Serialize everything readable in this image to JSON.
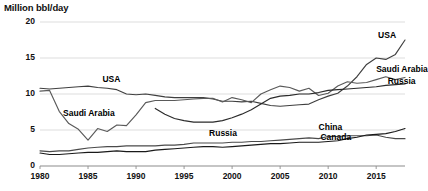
{
  "chart_data": {
    "type": "line",
    "title": "Million bbl/day",
    "xlabel": "",
    "ylabel": "Million bbl/day",
    "xlim": [
      1980,
      2018
    ],
    "ylim": [
      0,
      20
    ],
    "grid": true,
    "legend_position": "inline-annotations",
    "yticks": [
      "0",
      "5",
      "10",
      "15",
      "20"
    ],
    "ytick_values": [
      0,
      5,
      10,
      15,
      20
    ],
    "xticks": [
      "1980",
      "1985",
      "1990",
      "1995",
      "2000",
      "2005",
      "2010",
      "2015"
    ],
    "xtick_values": [
      1980,
      1985,
      1990,
      1995,
      2000,
      2005,
      2010,
      2015
    ],
    "x": [
      1980,
      1981,
      1982,
      1983,
      1984,
      1985,
      1986,
      1987,
      1988,
      1989,
      1990,
      1991,
      1992,
      1993,
      1994,
      1995,
      1996,
      1997,
      1998,
      1999,
      2000,
      2001,
      2002,
      2003,
      2004,
      2005,
      2006,
      2007,
      2008,
      2009,
      2010,
      2011,
      2012,
      2013,
      2014,
      2015,
      2016,
      2017,
      2018
    ],
    "series": [
      {
        "name": "USA",
        "color": "#3f3f3f",
        "values": [
          10.8,
          10.7,
          10.8,
          10.9,
          11.0,
          11.1,
          10.9,
          10.8,
          10.6,
          10.0,
          9.9,
          10.0,
          9.8,
          9.6,
          9.5,
          9.5,
          9.5,
          9.5,
          9.3,
          9.0,
          9.0,
          8.9,
          9.0,
          8.7,
          8.4,
          8.3,
          8.4,
          8.5,
          8.6,
          9.2,
          9.7,
          10.1,
          11.1,
          12.4,
          14.1,
          15.0,
          14.8,
          15.5,
          17.5
        ]
      },
      {
        "name": "Saudi Arabia",
        "color": "#5a5a5a",
        "values": [
          10.4,
          10.5,
          7.6,
          5.9,
          5.1,
          3.6,
          5.2,
          4.8,
          5.7,
          5.6,
          7.1,
          8.8,
          9.1,
          9.1,
          9.1,
          9.2,
          9.3,
          9.4,
          9.4,
          8.9,
          9.5,
          9.2,
          8.8,
          10.0,
          10.6,
          11.1,
          10.9,
          10.4,
          10.8,
          9.8,
          10.1,
          11.1,
          11.7,
          11.5,
          11.6,
          12.0,
          12.4,
          12.0,
          12.3
        ]
      },
      {
        "name": "Russia",
        "color": "#2b2b2b",
        "values": [
          null,
          null,
          null,
          null,
          null,
          null,
          null,
          null,
          null,
          null,
          null,
          null,
          8.0,
          7.2,
          6.6,
          6.3,
          6.1,
          6.1,
          6.1,
          6.3,
          6.7,
          7.2,
          7.8,
          8.6,
          9.4,
          9.7,
          9.8,
          10.0,
          10.0,
          10.2,
          10.5,
          10.6,
          10.7,
          10.8,
          10.9,
          11.0,
          11.2,
          11.3,
          11.4
        ]
      },
      {
        "name": "China",
        "color": "#4a4a4a",
        "values": [
          2.1,
          2.0,
          2.1,
          2.1,
          2.3,
          2.5,
          2.6,
          2.7,
          2.7,
          2.8,
          2.8,
          2.8,
          2.8,
          2.9,
          2.9,
          3.0,
          3.2,
          3.2,
          3.2,
          3.2,
          3.3,
          3.3,
          3.4,
          3.4,
          3.5,
          3.6,
          3.7,
          3.8,
          3.9,
          3.8,
          4.1,
          4.1,
          4.2,
          4.2,
          4.2,
          4.3,
          4.0,
          3.8,
          3.8
        ]
      },
      {
        "name": "Canada",
        "color": "#1a1a1a",
        "values": [
          1.8,
          1.6,
          1.6,
          1.7,
          1.8,
          1.9,
          1.9,
          2.0,
          2.1,
          2.0,
          2.0,
          2.0,
          2.2,
          2.3,
          2.4,
          2.5,
          2.6,
          2.7,
          2.7,
          2.6,
          2.7,
          2.8,
          2.9,
          3.0,
          3.1,
          3.1,
          3.2,
          3.3,
          3.3,
          3.3,
          3.4,
          3.5,
          3.8,
          4.0,
          4.3,
          4.4,
          4.5,
          4.8,
          5.2
        ]
      }
    ],
    "annotations": [
      {
        "text": "USA",
        "x": 1986.5,
        "y": 11.9
      },
      {
        "text": "Saudi Arabia",
        "x": 1982.4,
        "y": 7.2
      },
      {
        "text": "Russia",
        "x": 1997.6,
        "y": 4.5
      },
      {
        "text": "China",
        "x": 2009.0,
        "y": 5.3
      },
      {
        "text": "Canada",
        "x": 2009.2,
        "y": 3.9
      },
      {
        "text": "USA",
        "x": 2015.2,
        "y": 18.0
      },
      {
        "text": "Saudi Arabia",
        "x": 2015.0,
        "y": 13.4
      },
      {
        "text": "Russia",
        "x": 2016.2,
        "y": 11.6
      }
    ],
    "style": {
      "gridline_color": "#d9d9d9",
      "axis_color": "#8c8c8c",
      "background": "#ffffff"
    }
  }
}
